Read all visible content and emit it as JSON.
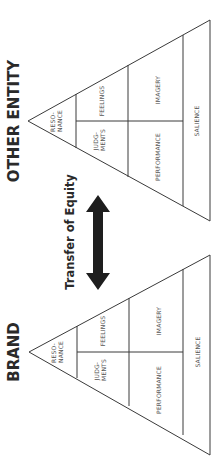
{
  "diagram": {
    "orientation": "rotated-90-ccw",
    "pyramids": [
      {
        "id": "other-entity",
        "title": "OTHER ENTITY",
        "cells": {
          "resonance": [
            "RESO-",
            "NANCE"
          ],
          "judgments": [
            "JUDG-",
            "MENTS"
          ],
          "feelings": "FEELINGS",
          "performance": "PERFORMANCE",
          "imagery": "IMAGERY",
          "salience": "SALIENCE"
        }
      },
      {
        "id": "brand",
        "title": "BRAND",
        "cells": {
          "resonance": [
            "RESO-",
            "NANCE"
          ],
          "judgments": [
            "JUDG-",
            "MENTS"
          ],
          "feelings": "FEELINGS",
          "performance": "PERFORMANCE",
          "imagery": "IMAGERY",
          "salience": "SALIENCE"
        }
      }
    ],
    "connector": {
      "label": "Transfer of Equity",
      "arrow": "double-headed-arrow",
      "color": "#1e1e1e"
    }
  }
}
